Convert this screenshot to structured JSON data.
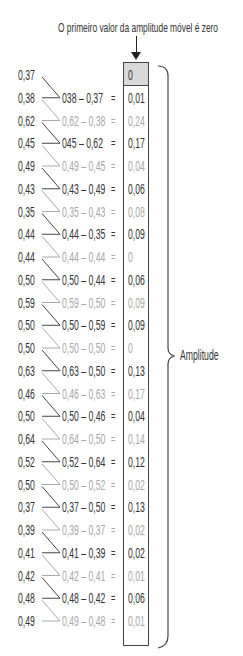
{
  "title": "O primeiro valor da amplitude móvel é zero",
  "brace_label": "Amplitude",
  "colors": {
    "dark_text": "#333333",
    "light_text": "#a8a8a8",
    "first_cell_fill": "#d9d9d9",
    "line": "#444444"
  },
  "rows": [
    {
      "value": "0,37",
      "expr": "",
      "eq": "",
      "result": "0",
      "tone": "dark"
    },
    {
      "value": "0,38",
      "expr": "038 – 0,37",
      "eq": "=",
      "result": "0,01",
      "tone": "dark"
    },
    {
      "value": "0,62",
      "expr": "0,62 – 0,38",
      "eq": "=",
      "result": "0,24",
      "tone": "light"
    },
    {
      "value": "0,45",
      "expr": "045 – 0,62",
      "eq": "=",
      "result": "0,17",
      "tone": "dark"
    },
    {
      "value": "0,49",
      "expr": "0,49 – 0,45",
      "eq": "=",
      "result": "0,04",
      "tone": "light"
    },
    {
      "value": "0,43",
      "expr": "0,43 – 0,49",
      "eq": "=",
      "result": "0,06",
      "tone": "dark"
    },
    {
      "value": "0,35",
      "expr": "0,35 – 0,43",
      "eq": "=",
      "result": "0,08",
      "tone": "light"
    },
    {
      "value": "0,44",
      "expr": "0,44 – 0,35",
      "eq": "=",
      "result": "0,09",
      "tone": "dark"
    },
    {
      "value": "0,44",
      "expr": "0,44 – 0,44",
      "eq": "=",
      "result": "0",
      "tone": "light"
    },
    {
      "value": "0,50",
      "expr": "0,50 – 0,44",
      "eq": "=",
      "result": "0,06",
      "tone": "dark"
    },
    {
      "value": "0,59",
      "expr": "0,59 – 0,50",
      "eq": "=",
      "result": "0,09",
      "tone": "light"
    },
    {
      "value": "0,50",
      "expr": "0,50 – 0,59",
      "eq": "=",
      "result": "0,09",
      "tone": "dark"
    },
    {
      "value": "0,50",
      "expr": "0,50 – 0,50",
      "eq": "=",
      "result": "0",
      "tone": "light"
    },
    {
      "value": "0,63",
      "expr": "0,63 – 0,50",
      "eq": "=",
      "result": "0,13",
      "tone": "dark"
    },
    {
      "value": "0,46",
      "expr": "0,46 – 0,63",
      "eq": "=",
      "result": "0,17",
      "tone": "light"
    },
    {
      "value": "0,50",
      "expr": "0,50 – 0,46",
      "eq": "=",
      "result": "0,04",
      "tone": "dark"
    },
    {
      "value": "0,64",
      "expr": "0,64 – 0,50",
      "eq": "=",
      "result": "0,14",
      "tone": "light"
    },
    {
      "value": "0,52",
      "expr": "0,52 – 0,64",
      "eq": "=",
      "result": "0,12",
      "tone": "dark"
    },
    {
      "value": "0,50",
      "expr": "0,50 – 0,52",
      "eq": "=",
      "result": "0,02",
      "tone": "light"
    },
    {
      "value": "0,37",
      "expr": "0,37 – 0,50",
      "eq": "=",
      "result": "0,13",
      "tone": "dark"
    },
    {
      "value": "0,39",
      "expr": "0,39 – 0,37",
      "eq": "=",
      "result": "0,02",
      "tone": "light"
    },
    {
      "value": "0,41",
      "expr": "0,41 – 0,39",
      "eq": "=",
      "result": "0,02",
      "tone": "dark"
    },
    {
      "value": "0,42",
      "expr": "0,42 – 0,41",
      "eq": "=",
      "result": "0,01",
      "tone": "light"
    },
    {
      "value": "0,48",
      "expr": "0,48 – 0,42",
      "eq": "=",
      "result": "0,06",
      "tone": "dark"
    },
    {
      "value": "0,49",
      "expr": "0,49 – 0,48",
      "eq": "=",
      "result": "0,01",
      "tone": "light"
    }
  ]
}
